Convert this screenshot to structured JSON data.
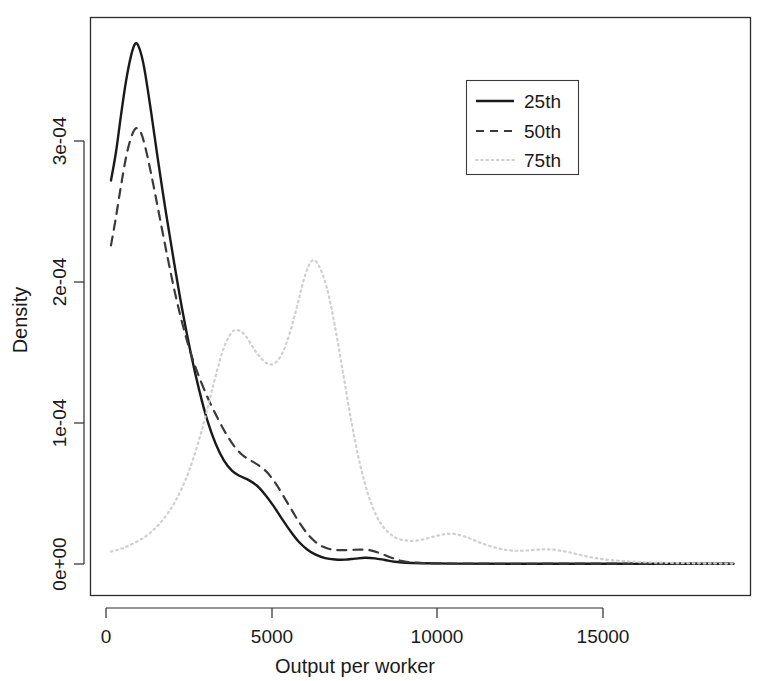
{
  "chart_data": {
    "type": "line",
    "title": "",
    "subtitle": "",
    "xlabel": "Output per worker",
    "ylabel": "Density",
    "xlim": [
      -400,
      19200
    ],
    "ylim": [
      -1.2e-05,
      0.000388
    ],
    "grid": false,
    "legend_position": "top-right",
    "x_ticks": [
      0,
      5000,
      10000,
      15000
    ],
    "x_tick_labels": [
      "0",
      "5000",
      "10000",
      "15000"
    ],
    "y_ticks": [
      0,
      0.0001,
      0.0002,
      0.0003
    ],
    "y_tick_labels": [
      "0e+00",
      "1e-04",
      "2e-04",
      "3e-04"
    ],
    "series": [
      {
        "name": "25th",
        "legend_label": "25th",
        "style": "solid",
        "color": "#1a1a1a",
        "points": [
          [
            150,
            0.000272
          ],
          [
            300,
            0.000292
          ],
          [
            450,
            0.000318
          ],
          [
            600,
            0.000342
          ],
          [
            750,
            0.00036
          ],
          [
            880,
            0.000369
          ],
          [
            1000,
            0.000366
          ],
          [
            1150,
            0.000352
          ],
          [
            1350,
            0.000322
          ],
          [
            1550,
            0.000289
          ],
          [
            1800,
            0.00025
          ],
          [
            2050,
            0.000214
          ],
          [
            2300,
            0.00018
          ],
          [
            2550,
            0.00015
          ],
          [
            2800,
            0.000124
          ],
          [
            3050,
            0.000102
          ],
          [
            3300,
            8.55e-05
          ],
          [
            3550,
            7.35e-05
          ],
          [
            3800,
            6.6e-05
          ],
          [
            4050,
            6.22e-05
          ],
          [
            4300,
            5.95e-05
          ],
          [
            4550,
            5.55e-05
          ],
          [
            4800,
            4.9e-05
          ],
          [
            5050,
            4.1e-05
          ],
          [
            5300,
            3.2e-05
          ],
          [
            5550,
            2.35e-05
          ],
          [
            5800,
            1.6e-05
          ],
          [
            6050,
            1.05e-05
          ],
          [
            6300,
            6.8e-06
          ],
          [
            6600,
            4.2e-06
          ],
          [
            6900,
            3.2e-06
          ],
          [
            7200,
            3.1e-06
          ],
          [
            7500,
            3.8e-06
          ],
          [
            7800,
            4.4e-06
          ],
          [
            8100,
            4e-06
          ],
          [
            8400,
            2.8e-06
          ],
          [
            8700,
            1.6e-06
          ],
          [
            9000,
            9e-07
          ],
          [
            9500,
            5e-07
          ],
          [
            10500,
            3e-07
          ],
          [
            12000,
            2e-07
          ],
          [
            14000,
            2e-07
          ],
          [
            16000,
            2e-07
          ],
          [
            18900,
            2e-07
          ]
        ]
      },
      {
        "name": "50th",
        "legend_label": "50th",
        "style": "dashed",
        "color": "#3a3a3a",
        "points": [
          [
            150,
            0.000226
          ],
          [
            300,
            0.000246
          ],
          [
            450,
            0.000268
          ],
          [
            600,
            0.000288
          ],
          [
            750,
            0.000302
          ],
          [
            900,
            0.000309
          ],
          [
            1050,
            0.000306
          ],
          [
            1200,
            0.000294
          ],
          [
            1400,
            0.000272
          ],
          [
            1600,
            0.000248
          ],
          [
            1850,
            0.000218
          ],
          [
            2100,
            0.00019
          ],
          [
            2350,
            0.000166
          ],
          [
            2600,
            0.000146
          ],
          [
            2850,
            0.00013
          ],
          [
            3100,
            0.000116
          ],
          [
            3350,
            0.000104
          ],
          [
            3600,
            9.3e-05
          ],
          [
            3850,
            8.4e-05
          ],
          [
            4100,
            7.75e-05
          ],
          [
            4350,
            7.35e-05
          ],
          [
            4600,
            7e-05
          ],
          [
            4850,
            6.5e-05
          ],
          [
            5100,
            5.75e-05
          ],
          [
            5350,
            4.8e-05
          ],
          [
            5600,
            3.8e-05
          ],
          [
            5850,
            2.85e-05
          ],
          [
            6100,
            2.05e-05
          ],
          [
            6400,
            1.4e-05
          ],
          [
            6700,
            1.08e-05
          ],
          [
            7000,
            9.8e-06
          ],
          [
            7350,
            1e-05
          ],
          [
            7700,
            1.02e-05
          ],
          [
            8000,
            9.5e-06
          ],
          [
            8300,
            7.2e-06
          ],
          [
            8600,
            4.4e-06
          ],
          [
            8900,
            2.2e-06
          ],
          [
            9300,
            1e-06
          ],
          [
            10000,
            4e-07
          ],
          [
            11500,
            2e-07
          ],
          [
            13500,
            2e-07
          ],
          [
            16000,
            2e-07
          ],
          [
            18900,
            2e-07
          ]
        ]
      },
      {
        "name": "75th",
        "legend_label": "75th",
        "style": "dotted",
        "color": "#cfcfcf",
        "points": [
          [
            150,
            8.8e-06
          ],
          [
            500,
            1.12e-05
          ],
          [
            900,
            1.55e-05
          ],
          [
            1300,
            2.15e-05
          ],
          [
            1700,
            3.1e-05
          ],
          [
            2100,
            4.5e-05
          ],
          [
            2500,
            6.6e-05
          ],
          [
            2900,
            9.6e-05
          ],
          [
            3200,
            0.000124
          ],
          [
            3500,
            0.00015
          ],
          [
            3750,
            0.000163
          ],
          [
            3950,
            0.000166
          ],
          [
            4200,
            0.000162
          ],
          [
            4500,
            0.000151
          ],
          [
            4800,
            0.000143
          ],
          [
            5050,
            0.000142
          ],
          [
            5300,
            0.000149
          ],
          [
            5550,
            0.000165
          ],
          [
            5800,
            0.000187
          ],
          [
            6000,
            0.000205
          ],
          [
            6200,
            0.000215
          ],
          [
            6400,
            0.000212
          ],
          [
            6650,
            0.000196
          ],
          [
            6900,
            0.000168
          ],
          [
            7150,
            0.000134
          ],
          [
            7400,
            0.0001
          ],
          [
            7650,
            7.1e-05
          ],
          [
            7900,
            4.9e-05
          ],
          [
            8150,
            3.4e-05
          ],
          [
            8400,
            2.5e-05
          ],
          [
            8700,
            1.9e-05
          ],
          [
            9000,
            1.68e-05
          ],
          [
            9350,
            1.66e-05
          ],
          [
            9700,
            1.83e-05
          ],
          [
            10000,
            2.02e-05
          ],
          [
            10300,
            2.14e-05
          ],
          [
            10600,
            2.08e-05
          ],
          [
            10950,
            1.82e-05
          ],
          [
            11300,
            1.48e-05
          ],
          [
            11700,
            1.18e-05
          ],
          [
            12100,
            9.8e-06
          ],
          [
            12500,
            9.4e-06
          ],
          [
            12900,
            1e-05
          ],
          [
            13250,
            1.04e-05
          ],
          [
            13600,
            9.8e-06
          ],
          [
            14000,
            8e-06
          ],
          [
            14400,
            5.8e-06
          ],
          [
            14800,
            4e-06
          ],
          [
            15300,
            2.6e-06
          ],
          [
            15900,
            1.6e-06
          ],
          [
            16600,
            1e-06
          ],
          [
            17400,
            6e-07
          ],
          [
            18200,
            4e-07
          ],
          [
            18900,
            3e-07
          ]
        ]
      }
    ]
  },
  "legend": {
    "entries": [
      {
        "label": "25th"
      },
      {
        "label": "50th"
      },
      {
        "label": "75th"
      }
    ]
  },
  "axes": {
    "x_title": "Output per worker",
    "y_title": "Density"
  }
}
